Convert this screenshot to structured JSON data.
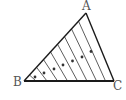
{
  "diagram": {
    "type": "geometry",
    "stroke_color": "#1a1a1a",
    "label_color": "#555555",
    "vertices": {
      "A": {
        "label": "A",
        "x": 86,
        "y": 13
      },
      "B": {
        "label": "B",
        "x": 24,
        "y": 81
      },
      "C": {
        "label": "C",
        "x": 114,
        "y": 81
      }
    },
    "parallel_segments_count": 8,
    "dots_count": 7
  }
}
